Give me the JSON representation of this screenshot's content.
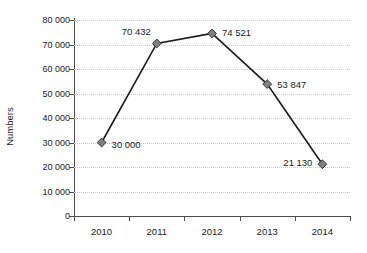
{
  "chart_data": {
    "type": "line",
    "title": "",
    "xlabel": "",
    "ylabel": "Numbers",
    "categories": [
      "2010",
      "2011",
      "2012",
      "2013",
      "2014"
    ],
    "values": [
      30000,
      70432,
      74521,
      53847,
      21130
    ],
    "point_labels": [
      "30 000",
      "70 432",
      "74 521",
      "53 847",
      "21 130"
    ],
    "series": [
      {
        "name": "Numbers",
        "values": [
          30000,
          70432,
          74521,
          53847,
          21130
        ]
      }
    ],
    "ylim": [
      0,
      80000
    ],
    "ytick_values": [
      0,
      10000,
      20000,
      30000,
      40000,
      50000,
      60000,
      70000,
      80000
    ],
    "ytick_labels": [
      "0",
      "10 000",
      "20 000",
      "30 000",
      "40 000",
      "50 000",
      "60 000",
      "70 000",
      "80 000"
    ],
    "grid": "horizontal-dotted",
    "legend": "none",
    "marker": "diamond",
    "colors": {
      "line": "#1a1a1a",
      "marker_fill": "#808080",
      "marker_stroke": "#333333",
      "grid": "#c9c9c9",
      "axis": "#4d4d4d",
      "text": "#1a1a1a",
      "background": "#ffffff"
    }
  }
}
